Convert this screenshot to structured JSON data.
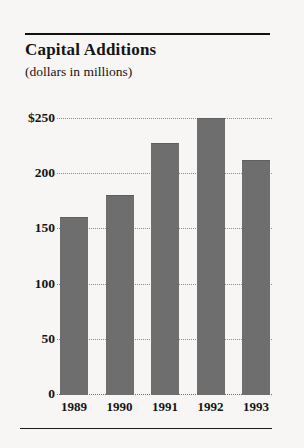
{
  "chart_data": {
    "type": "bar",
    "title": "Capital Additions",
    "subtitle": "(dollars in millions)",
    "xlabel": "",
    "ylabel": "",
    "categories": [
      "1989",
      "1990",
      "1991",
      "1992",
      "1993"
    ],
    "values": [
      160,
      180,
      227,
      250,
      212
    ],
    "ylim": [
      0,
      250
    ],
    "yticks": [
      0,
      50,
      100,
      150,
      200,
      250
    ],
    "ytick_labels": [
      "0",
      "50",
      "100",
      "150",
      "200",
      "$250"
    ],
    "grid": true,
    "legend": false,
    "bar_color": "#6e6e6e",
    "background_color": "#f7f6f4",
    "text_color": "#141414"
  }
}
